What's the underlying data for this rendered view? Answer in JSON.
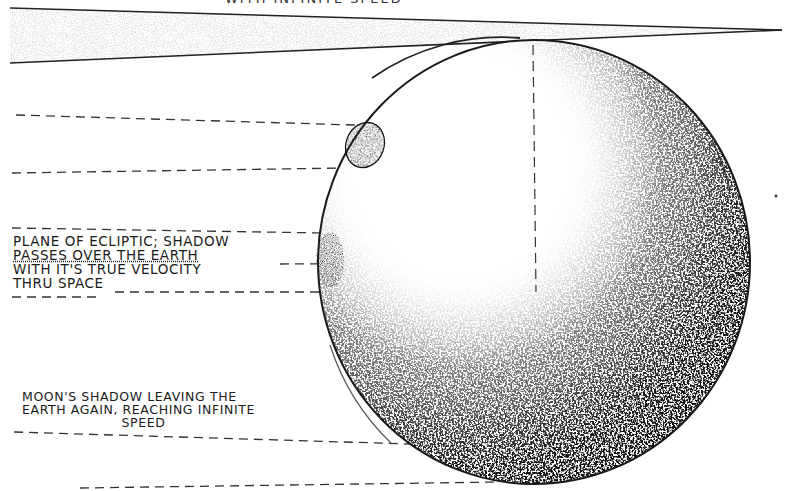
{
  "diagram": {
    "top_caption_partial": "WITH INFINITE SPEED",
    "labels": {
      "ecliptic": {
        "line1": "Plane of ecliptic; shadow",
        "line2": "passes over the earth",
        "line3": "with it's true velocity",
        "line4": "thru space"
      },
      "leaving": {
        "line1": "Moon's shadow leaving the",
        "line2": "earth again, reaching infinite",
        "line3": "speed"
      }
    },
    "elements": {
      "shadow_cone": "moon-shadow-cone-wedge",
      "globe": "earth-stippled-globe",
      "shadow_spots": [
        "upper-shadow-spot",
        "middle-shadow-spot"
      ],
      "guide_lines": "dashed-horizontal-lines",
      "axes": "dashed-crosshair-axes"
    },
    "colors": {
      "ink": "#1a1a1a",
      "paper": "#ffffff",
      "cone_fill": "#d9d9d9"
    }
  }
}
